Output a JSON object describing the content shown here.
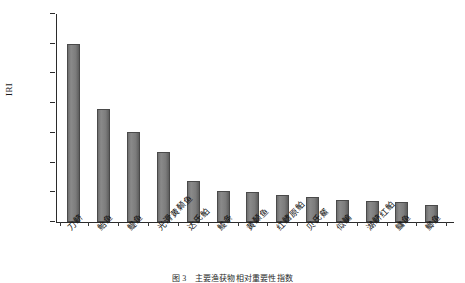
{
  "chart_data": {
    "type": "bar",
    "title": "",
    "caption": "图 3　主要渔获物相对重要性指数",
    "xlabel": "",
    "ylabel": "IRI",
    "ylim": [
      0,
      3500
    ],
    "ytick_step": 500,
    "ytick_labels": [
      "0",
      "500",
      "1 000",
      "1 500",
      "2 000",
      "2 500",
      "3 000",
      "3 500"
    ],
    "ytick_values": [
      0,
      500,
      1000,
      1500,
      2000,
      2500,
      3000,
      3500
    ],
    "grid": false,
    "legend": "none",
    "bar_color": "#7c7c7c",
    "bar_edge_color": "#4a4a4a",
    "axis_color": "#2b2b2b",
    "categories": [
      "刀鲚",
      "鲐鱼",
      "鳀鱼",
      "光滑黄颡鱼",
      "达氏鲌",
      "鮻条",
      "黄颡鱼",
      "红鳍原鲌",
      "贝氏䱗",
      "似鳊",
      "湖鲚红鲌",
      "鳙鱼",
      "鲫鱼"
    ],
    "values": [
      2995,
      1900,
      1520,
      1175,
      690,
      530,
      510,
      460,
      420,
      370,
      355,
      345,
      290
    ]
  }
}
